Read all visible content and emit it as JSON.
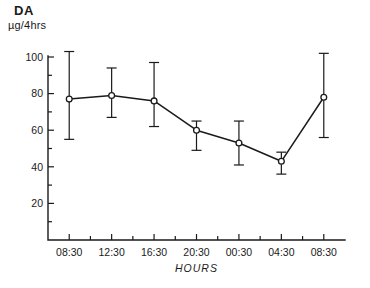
{
  "header": {
    "title": "DA",
    "unit": "µg/4hrs"
  },
  "chart_data": {
    "type": "line",
    "title": "DA",
    "xlabel": "HOURS",
    "ylabel": "µg/4hrs",
    "categories": [
      "08:30",
      "12:30",
      "16:30",
      "20:30",
      "00:30",
      "04:30",
      "08:30"
    ],
    "values": [
      77,
      79,
      76,
      60,
      53,
      43,
      78
    ],
    "error_upper": [
      103,
      94,
      97,
      65,
      65,
      48,
      102
    ],
    "error_lower": [
      55,
      67,
      62,
      49,
      41,
      36,
      56
    ],
    "ylim": [
      0,
      100
    ],
    "ytick_labels": [
      "20",
      "40",
      "60",
      "80",
      "100"
    ],
    "ytick_values": [
      20,
      40,
      60,
      80,
      100
    ],
    "yminor_step": 10,
    "grid": false,
    "legend": "none",
    "marker": "open-circle",
    "errorbars": "vertical-capped"
  }
}
